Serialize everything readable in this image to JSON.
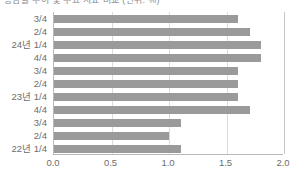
{
  "title_clipped": "증감률 추이 및 주요 지표 비교 (단위: %)",
  "colors": {
    "bar": "#9a9a9a",
    "gridline": "#dcdcdc",
    "axis": "#b9b9b9",
    "text": "#6d6d6d"
  },
  "chart_data": {
    "type": "bar",
    "orientation": "horizontal",
    "title": "",
    "xlabel": "",
    "ylabel": "",
    "xlim": [
      0.0,
      2.0
    ],
    "xticks": [
      0.0,
      0.5,
      1.0,
      1.5,
      2.0
    ],
    "xtick_labels": [
      "0.0",
      "0.5",
      "1.0",
      "1.5",
      "2.0"
    ],
    "grid": true,
    "legend": false,
    "categories": [
      "3/4",
      "2/4",
      "24년 1/4",
      "4/4",
      "3/4",
      "2/4",
      "23년 1/4",
      "4/4",
      "3/4",
      "2/4",
      "22년 1/4"
    ],
    "values": [
      1.6,
      1.7,
      1.8,
      1.8,
      1.6,
      1.6,
      1.6,
      1.7,
      1.1,
      1.0,
      1.1
    ]
  }
}
